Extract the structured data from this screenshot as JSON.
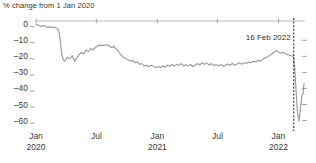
{
  "chart_data": {
    "type": "line",
    "title": "% change from 1 Jan 2020",
    "xlabel": "",
    "ylabel": "",
    "ylim": [
      -65,
      3
    ],
    "xlim": [
      "2020-01-01",
      "2022-03-20"
    ],
    "grid": false,
    "legend": null,
    "y_ticks": [
      0,
      -10,
      -20,
      -30,
      -40,
      -50,
      -60
    ],
    "y_tick_labels": [
      "0",
      "–10",
      "–20",
      "–30",
      "–40",
      "–50",
      "–60"
    ],
    "x_ticks": [
      "2020-01",
      "2020-07",
      "2021-01",
      "2021-07",
      "2022-01"
    ],
    "x_tick_labels": [
      {
        "line1": "Jan",
        "line2": "2020"
      },
      {
        "line1": "Jul",
        "line2": ""
      },
      {
        "line1": "Jan",
        "line2": "2021"
      },
      {
        "line1": "Jul",
        "line2": ""
      },
      {
        "line1": "Jan",
        "line2": "2022"
      }
    ],
    "annotations": [
      {
        "name": "event-marker",
        "label": "16 Feb 2022",
        "x": "2022-02-16",
        "style": "dashed-vertical-line"
      }
    ],
    "series": [
      {
        "name": "percent change from 1 Jan 2020",
        "color": "#9a9a9a",
        "x": [
          "2020-01-01",
          "2020-01-08",
          "2020-01-15",
          "2020-01-22",
          "2020-01-29",
          "2020-02-05",
          "2020-02-12",
          "2020-02-19",
          "2020-02-26",
          "2020-03-04",
          "2020-03-09",
          "2020-03-13",
          "2020-03-16",
          "2020-03-19",
          "2020-03-23",
          "2020-03-27",
          "2020-03-31",
          "2020-04-05",
          "2020-04-12",
          "2020-04-19",
          "2020-04-26",
          "2020-05-03",
          "2020-05-10",
          "2020-05-17",
          "2020-05-24",
          "2020-05-31",
          "2020-06-07",
          "2020-06-14",
          "2020-06-21",
          "2020-06-28",
          "2020-07-05",
          "2020-07-12",
          "2020-07-19",
          "2020-07-26",
          "2020-08-02",
          "2020-08-09",
          "2020-08-16",
          "2020-08-23",
          "2020-08-30",
          "2020-09-06",
          "2020-09-13",
          "2020-09-20",
          "2020-09-27",
          "2020-10-04",
          "2020-10-11",
          "2020-10-18",
          "2020-10-25",
          "2020-11-01",
          "2020-11-08",
          "2020-11-15",
          "2020-11-22",
          "2020-11-29",
          "2020-12-06",
          "2020-12-13",
          "2020-12-20",
          "2020-12-27",
          "2021-01-03",
          "2021-01-10",
          "2021-01-17",
          "2021-01-24",
          "2021-01-31",
          "2021-02-07",
          "2021-02-14",
          "2021-02-21",
          "2021-02-28",
          "2021-03-07",
          "2021-03-14",
          "2021-03-21",
          "2021-03-28",
          "2021-04-04",
          "2021-04-11",
          "2021-04-18",
          "2021-04-25",
          "2021-05-02",
          "2021-05-09",
          "2021-05-16",
          "2021-05-23",
          "2021-05-30",
          "2021-06-06",
          "2021-06-13",
          "2021-06-20",
          "2021-06-27",
          "2021-07-04",
          "2021-07-11",
          "2021-07-18",
          "2021-07-25",
          "2021-08-01",
          "2021-08-08",
          "2021-08-15",
          "2021-08-22",
          "2021-08-29",
          "2021-09-05",
          "2021-09-12",
          "2021-09-19",
          "2021-09-26",
          "2021-10-03",
          "2021-10-10",
          "2021-10-17",
          "2021-10-24",
          "2021-10-31",
          "2021-11-07",
          "2021-11-14",
          "2021-11-21",
          "2021-11-28",
          "2021-12-05",
          "2021-12-12",
          "2021-12-19",
          "2021-12-26",
          "2022-01-02",
          "2022-01-09",
          "2022-01-16",
          "2022-01-23",
          "2022-01-30",
          "2022-02-06",
          "2022-02-13",
          "2022-02-16",
          "2022-02-19",
          "2022-02-22",
          "2022-02-25",
          "2022-02-27",
          "2022-03-01",
          "2022-03-04",
          "2022-03-07",
          "2022-03-10",
          "2022-03-13",
          "2022-03-16",
          "2022-03-19"
        ],
        "y": [
          0,
          -0.5,
          -1.5,
          -0.8,
          -1.2,
          -2.0,
          -1.5,
          -2.2,
          -1.8,
          -2.5,
          -3.5,
          -8.0,
          -14.0,
          -19.0,
          -22.0,
          -23.0,
          -22.0,
          -20.5,
          -21.5,
          -19.5,
          -23.0,
          -21.0,
          -19.0,
          -17.5,
          -18.5,
          -16.0,
          -17.0,
          -15.0,
          -16.0,
          -14.5,
          -13.5,
          -13.0,
          -13.2,
          -13.0,
          -12.8,
          -13.5,
          -14.5,
          -13.8,
          -15.5,
          -17.0,
          -19.0,
          -20.5,
          -21.5,
          -22.0,
          -23.0,
          -22.5,
          -24.0,
          -23.5,
          -25.0,
          -24.5,
          -26.0,
          -25.5,
          -26.5,
          -25.5,
          -26.0,
          -27.0,
          -26.5,
          -27.0,
          -26.0,
          -26.8,
          -25.5,
          -26.2,
          -25.0,
          -26.0,
          -25.0,
          -25.5,
          -24.5,
          -26.0,
          -25.2,
          -26.0,
          -25.0,
          -26.5,
          -25.5,
          -24.5,
          -25.5,
          -24.0,
          -25.0,
          -24.2,
          -25.5,
          -24.5,
          -25.8,
          -25.0,
          -26.0,
          -25.0,
          -26.2,
          -25.5,
          -24.8,
          -25.5,
          -24.5,
          -25.5,
          -24.8,
          -24.0,
          -25.0,
          -24.0,
          -24.5,
          -23.5,
          -24.0,
          -23.0,
          -23.5,
          -22.5,
          -23.0,
          -22.0,
          -21.0,
          -20.5,
          -19.5,
          -18.5,
          -17.5,
          -16.5,
          -17.5,
          -18.0,
          -17.5,
          -18.5,
          -19.0,
          -19.5,
          -20.0,
          -20.5,
          -27.0,
          -38.0,
          -48.0,
          -54.0,
          -57.0,
          -60.5,
          -55.0,
          -49.0,
          -44.0,
          -43.5,
          -37.0
        ]
      }
    ]
  },
  "source_caption": ""
}
